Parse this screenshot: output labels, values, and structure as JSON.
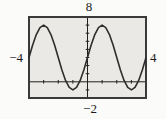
{
  "chart_data": {
    "type": "line",
    "title": "",
    "xlabel": "",
    "ylabel": "",
    "window": {
      "xmin": -4,
      "xmax": 4,
      "ymin": -2,
      "ymax": 8,
      "xscl": 1,
      "yscl": 1
    },
    "boundary_labels": {
      "top": "8",
      "left": "−4",
      "right": "4",
      "bottom": "−2"
    },
    "grid": false,
    "legend": false,
    "function_estimate": "y = 4·sin(πx/2) + 3",
    "series": [
      {
        "name": "sinusoid",
        "x": [
          -4,
          -3.75,
          -3.5,
          -3.25,
          -3,
          -2.75,
          -2.5,
          -2.25,
          -2,
          -1.75,
          -1.5,
          -1.25,
          -1,
          -0.75,
          -0.5,
          -0.25,
          0,
          0.25,
          0.5,
          0.75,
          1,
          1.25,
          1.5,
          1.75,
          2,
          2.25,
          2.5,
          2.75,
          3,
          3.25,
          3.5,
          3.75,
          4
        ],
        "y": [
          3,
          4.531,
          5.828,
          6.696,
          7,
          6.696,
          5.828,
          4.531,
          3,
          1.469,
          0.172,
          -0.696,
          -1,
          -0.696,
          0.172,
          1.469,
          3,
          4.531,
          5.828,
          6.696,
          7,
          6.696,
          5.828,
          4.531,
          3,
          1.469,
          0.172,
          -0.696,
          -1,
          -0.696,
          0.172,
          1.469,
          3
        ]
      }
    ],
    "colors": {
      "border": "#3a3a3a",
      "background": "#eae9e5",
      "axis": "#1f1f1f",
      "curve": "#2e2e2e",
      "text": "#1a1a1a"
    }
  }
}
